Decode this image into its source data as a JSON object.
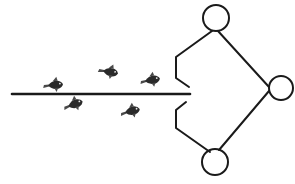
{
  "diagram": {
    "colors": {
      "background": "#ffffff",
      "ink": "#1a1a1a",
      "fish": "#2a2a2a"
    },
    "nodes": [
      {
        "id": "top-circle",
        "cx": 216,
        "cy": 18,
        "r": 13
      },
      {
        "id": "right-circle",
        "cx": 281,
        "cy": 88,
        "r": 12
      },
      {
        "id": "bottom-circle",
        "cx": 215,
        "cy": 162,
        "r": 13
      }
    ],
    "guide_line": {
      "x1": 12,
      "y1": 94,
      "x2": 190,
      "y2": 94
    },
    "fish": [
      {
        "id": "fish-1",
        "x": 55,
        "y": 85,
        "rotation": -5
      },
      {
        "id": "fish-2",
        "x": 110,
        "y": 72,
        "rotation": 10
      },
      {
        "id": "fish-3",
        "x": 152,
        "y": 80,
        "rotation": -10
      },
      {
        "id": "fish-4",
        "x": 75,
        "y": 104,
        "rotation": -20
      },
      {
        "id": "fish-5",
        "x": 132,
        "y": 111,
        "rotation": -15
      }
    ]
  }
}
